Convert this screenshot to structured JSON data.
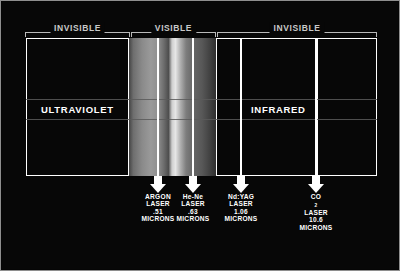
{
  "slide": {
    "title": "Electromagnetic spectrum with laser wavelengths"
  },
  "brackets": [
    {
      "label": "INVISIBLE"
    },
    {
      "label": "VISIBLE"
    },
    {
      "label": "INVISIBLE"
    }
  ],
  "bands": [
    {
      "name": "ULTRAVIOLET"
    },
    {
      "name": "INFRARED"
    }
  ],
  "lasers": [
    {
      "name": "ARGON",
      "kind": "LASER",
      "value": ".51",
      "unit": "MICRONS",
      "sub": ""
    },
    {
      "name": "He-Ne",
      "kind": "LASER",
      "value": ".63",
      "unit": "MICRONS",
      "sub": ""
    },
    {
      "name": "Nd:YAG",
      "kind": "LASER",
      "value": "1.06",
      "unit": "MICRONS",
      "sub": ""
    },
    {
      "name": "CO",
      "kind": "LASER",
      "value": "10.6",
      "unit": "MICRONS",
      "sub": "2"
    }
  ],
  "colors": {
    "background": "#070707",
    "outline": "#ffffff",
    "bracket": "#b9b9b9",
    "bracket_label": "#c9c9c9",
    "rule": "#5a5a5a",
    "border": "#8e8e8e"
  }
}
